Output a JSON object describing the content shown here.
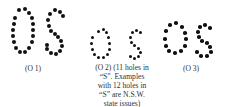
{
  "figures": [
    {
      "id": "O1",
      "letters": "OS",
      "caption": "(O 1)",
      "dot_size": 4,
      "dots": [
        [
          19,
          10
        ],
        [
          25,
          9
        ],
        [
          29,
          13
        ],
        [
          32,
          18
        ],
        [
          33,
          24
        ],
        [
          33,
          30
        ],
        [
          33,
          36
        ],
        [
          32,
          42
        ],
        [
          29,
          48
        ],
        [
          25,
          52
        ],
        [
          20,
          52
        ],
        [
          16,
          48
        ],
        [
          14,
          42
        ],
        [
          13,
          36
        ],
        [
          13,
          30
        ],
        [
          14,
          24
        ],
        [
          15,
          18
        ],
        [
          50,
          14
        ],
        [
          55,
          10
        ],
        [
          60,
          12
        ],
        [
          63,
          16
        ],
        [
          48,
          20
        ],
        [
          49,
          26
        ],
        [
          51,
          31
        ],
        [
          55,
          34
        ],
        [
          58,
          37
        ],
        [
          61,
          41
        ],
        [
          62,
          46
        ],
        [
          60,
          51
        ],
        [
          56,
          54
        ],
        [
          51,
          53
        ],
        [
          47,
          49
        ],
        [
          47,
          45
        ]
      ]
    },
    {
      "id": "O2",
      "letters": "OS",
      "caption_lines": [
        "(O 2) (11 holes in",
        "“S”. Examples",
        "with 12 holes in",
        "“S” are N.S.W.",
        "state issues)"
      ],
      "dot_size": 3,
      "dots": [
        [
          98,
          31
        ],
        [
          103,
          29
        ],
        [
          106,
          32
        ],
        [
          108,
          37
        ],
        [
          109,
          43
        ],
        [
          109,
          49
        ],
        [
          107,
          54
        ],
        [
          103,
          57
        ],
        [
          98,
          57
        ],
        [
          94,
          54
        ],
        [
          92,
          49
        ],
        [
          91,
          43
        ],
        [
          92,
          37
        ],
        [
          132,
          32
        ],
        [
          136,
          30
        ],
        [
          140,
          32
        ],
        [
          130,
          37
        ],
        [
          131,
          42
        ],
        [
          134,
          45
        ],
        [
          138,
          48
        ],
        [
          140,
          52
        ],
        [
          138,
          56
        ],
        [
          134,
          58
        ],
        [
          130,
          56
        ]
      ]
    },
    {
      "id": "O3",
      "letters": "OS",
      "caption": "(O 3)",
      "dot_size": 3.5,
      "dots": [
        [
          170,
          25
        ],
        [
          176,
          23
        ],
        [
          182,
          27
        ],
        [
          185,
          33
        ],
        [
          186,
          39
        ],
        [
          185,
          46
        ],
        [
          181,
          51
        ],
        [
          175,
          53
        ],
        [
          169,
          51
        ],
        [
          166,
          46
        ],
        [
          165,
          39
        ],
        [
          166,
          31
        ],
        [
          200,
          27
        ],
        [
          205,
          25
        ],
        [
          210,
          28
        ],
        [
          198,
          32
        ],
        [
          199,
          37
        ],
        [
          202,
          41
        ],
        [
          207,
          43
        ],
        [
          210,
          47
        ],
        [
          211,
          52
        ],
        [
          207,
          56
        ],
        [
          201,
          56
        ],
        [
          197,
          52
        ]
      ]
    }
  ]
}
